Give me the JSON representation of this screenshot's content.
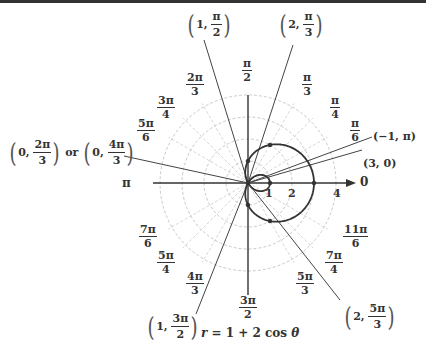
{
  "chart_data": {
    "type": "polar",
    "title": "",
    "equation": "r = 1 + 2 cos θ",
    "curve": "limaçon with inner loop",
    "r_ticks": [
      "1",
      "2",
      "4"
    ],
    "r_range": [
      0,
      4
    ],
    "zero_axis_label": "0",
    "pi_axis_label": "π",
    "angle_labels": [
      "π/6",
      "π/4",
      "π/3",
      "π/2",
      "2π/3",
      "3π/4",
      "5π/6",
      "π",
      "7π/6",
      "5π/4",
      "4π/3",
      "3π/2",
      "5π/3",
      "7π/4",
      "11π/6",
      "0"
    ],
    "labeled_points": [
      {
        "label": "(3, 0)",
        "r": 3,
        "theta": "0"
      },
      {
        "label": "(−1, π)",
        "r": -1,
        "theta": "π"
      },
      {
        "label": "(2, π/3)",
        "r": 2,
        "theta": "π/3"
      },
      {
        "label": "(1, π/2)",
        "r": 1,
        "theta": "π/2"
      },
      {
        "label": "(0, 2π/3) or (0, 4π/3)",
        "r": 0,
        "theta": "2π/3 or 4π/3"
      },
      {
        "label": "(1, 3π/2)",
        "r": 1,
        "theta": "3π/2"
      },
      {
        "label": "(2, 5π/3)",
        "r": 2,
        "theta": "5π/3"
      }
    ],
    "grid": "dashed concentric circles and radial lines"
  },
  "angles": {
    "pi_6": {
      "n": "π",
      "d": "6"
    },
    "pi_4": {
      "n": "π",
      "d": "4"
    },
    "pi_3": {
      "n": "π",
      "d": "3"
    },
    "pi_2": {
      "n": "π",
      "d": "2"
    },
    "two_pi_3": {
      "n": "2π",
      "d": "3"
    },
    "three_pi_4": {
      "n": "3π",
      "d": "4"
    },
    "five_pi_6": {
      "n": "5π",
      "d": "6"
    },
    "pi": "π",
    "seven_pi_6": {
      "n": "7π",
      "d": "6"
    },
    "five_pi_4": {
      "n": "5π",
      "d": "4"
    },
    "four_pi_3": {
      "n": "4π",
      "d": "3"
    },
    "three_pi_2": {
      "n": "3π",
      "d": "2"
    },
    "five_pi_3": {
      "n": "5π",
      "d": "3"
    },
    "seven_pi_4": {
      "n": "7π",
      "d": "4"
    },
    "eleven_pi_6": {
      "n": "11π",
      "d": "6"
    },
    "zero": "0"
  },
  "ticks": {
    "one": "1",
    "two": "2",
    "four": "4"
  },
  "points": {
    "p_1_pi2": {
      "r": "1,",
      "n": "π",
      "d": "2"
    },
    "p_2_pi3": {
      "r": "2,",
      "n": "π",
      "d": "3"
    },
    "p_neg1_pi": "(−1, π)",
    "p_3_0": "(3, 0)",
    "p_0": {
      "a_r": "0,",
      "a_n": "2π",
      "a_d": "3",
      "or": "or",
      "b_r": "0,",
      "b_n": "4π",
      "b_d": "3"
    },
    "p_1_3pi2": {
      "r": "1,",
      "n": "3π",
      "d": "2"
    },
    "p_2_5pi3": {
      "r": "2,",
      "n": "5π",
      "d": "3"
    }
  },
  "equation": {
    "lhs": "r",
    "rhs": " = 1 + 2 cos ",
    "theta": "θ"
  },
  "colors": {
    "curve": "#333333",
    "grid": "#bbbbbb",
    "axis": "#333333"
  }
}
